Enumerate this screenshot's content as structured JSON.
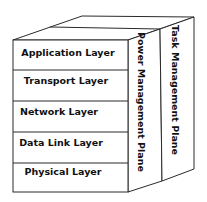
{
  "diagram": {
    "type": "layered-stack-3d",
    "layers": [
      {
        "label": "Application Layer"
      },
      {
        "label": "Transport Layer"
      },
      {
        "label": "Network Layer"
      },
      {
        "label": "Data Link Layer"
      },
      {
        "label": "Physical Layer"
      }
    ],
    "planes": [
      {
        "label": "Power Management Plane"
      },
      {
        "label": "Task Management Plane"
      }
    ],
    "colors": {
      "line": "#2a2a2a",
      "text": "#111111",
      "background": "#ffffff"
    }
  }
}
